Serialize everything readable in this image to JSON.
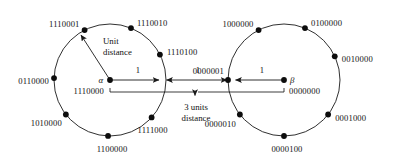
{
  "figure": {
    "background": "#ffffff",
    "stroke_color": "#1a1a1a",
    "node_color": "#0d0d0d",
    "width": 394,
    "height": 168
  },
  "annotations": {
    "unit_distance_line1": "Unit",
    "unit_distance_line2": "distance",
    "three_units_line1": "3 units",
    "three_units_line2": "distance",
    "segment_label_left": "1",
    "segment_label_middle": "1",
    "segment_label_right": "1"
  },
  "left_sphere": {
    "center_symbol": "α",
    "center_codeword": "1110000",
    "center": {
      "x": 110,
      "y": 80
    },
    "radius": 56,
    "nodes": [
      {
        "label": "1110010",
        "angle_deg": 68,
        "label_dx": 6,
        "label_dy": -5,
        "anchor": "start"
      },
      {
        "label": "1110001",
        "angle_deg": 117,
        "label_dx": -5,
        "label_dy": -6,
        "anchor": "end"
      },
      {
        "label": "0110000",
        "angle_deg": 178,
        "label_dx": -5,
        "label_dy": 3,
        "anchor": "end"
      },
      {
        "label": "1010000",
        "angle_deg": 218,
        "label_dx": -4,
        "label_dy": 9,
        "anchor": "end"
      },
      {
        "label": "1100000",
        "angle_deg": 268,
        "label_dx": 4,
        "label_dy": 13,
        "anchor": "middle"
      },
      {
        "label": "1111000",
        "angle_deg": 318,
        "label_dx": 1,
        "label_dy": 13,
        "anchor": "middle"
      },
      {
        "label": "1110100",
        "angle_deg": 27,
        "label_dx": 7,
        "label_dy": -3,
        "anchor": "start"
      }
    ]
  },
  "right_sphere": {
    "center_symbol": "β",
    "center_codeword": "0000000",
    "center": {
      "x": 284,
      "y": 80
    },
    "radius": 56,
    "nodes": [
      {
        "label": "0100000",
        "angle_deg": 68,
        "label_dx": 6,
        "label_dy": -5,
        "anchor": "start"
      },
      {
        "label": "1000000",
        "angle_deg": 117,
        "label_dx": -5,
        "label_dy": -6,
        "anchor": "end"
      },
      {
        "label": "0000001",
        "angle_deg": 180,
        "label_dx": -4,
        "label_dy": -9,
        "anchor": "end"
      },
      {
        "label": "0000010",
        "angle_deg": 218,
        "label_dx": -4,
        "label_dy": 10,
        "anchor": "end"
      },
      {
        "label": "0000100",
        "angle_deg": 270,
        "label_dx": 3,
        "label_dy": 13,
        "anchor": "middle"
      },
      {
        "label": "0001000",
        "angle_deg": 322,
        "label_dx": 7,
        "label_dy": 4,
        "anchor": "start"
      },
      {
        "label": "0010000",
        "angle_deg": 25,
        "label_dx": 7,
        "label_dy": 3,
        "anchor": "start"
      }
    ]
  },
  "chart_data": {
    "type": "diagram",
    "centers": [
      "1110000",
      "0000000"
    ],
    "left_sphere_members": [
      "1110010",
      "1110001",
      "0110000",
      "1010000",
      "1100000",
      "1111000",
      "1110100"
    ],
    "right_sphere_members": [
      "0100000",
      "1000000",
      "0000001",
      "0000010",
      "0000100",
      "0001000",
      "0010000"
    ],
    "unit_distance": 1,
    "center_to_center_distance": "3 units",
    "measured_segments": [
      1,
      1,
      1
    ]
  }
}
